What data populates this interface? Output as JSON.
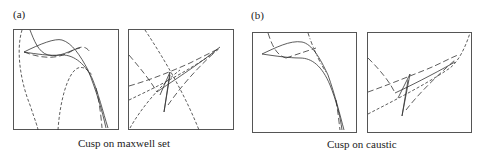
{
  "figure": {
    "panels": [
      {
        "id": "a",
        "label": "(a)",
        "caption": "Cusp on maxwell set",
        "subplots": [
          "wavefront-profile",
          "cusp-close-up"
        ]
      },
      {
        "id": "b",
        "label": "(b)",
        "caption": "Cusp on caustic",
        "subplots": [
          "wavefront-profile",
          "cusp-close-up"
        ]
      }
    ],
    "line_styles": {
      "solid": "curve",
      "long-dash": "dashed curve",
      "short-dash": "dotted curve"
    },
    "stroke_color": "#333333"
  }
}
